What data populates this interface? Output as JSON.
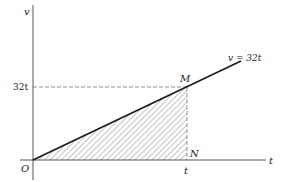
{
  "diagram": {
    "type": "velocity-time graph",
    "axes": {
      "y_label": "v",
      "x_label": "t",
      "origin_label": "O"
    },
    "line_label": "v = 32t",
    "y_tick_label": "32t",
    "x_tick_label": "t",
    "points": {
      "M": "M",
      "N": "N"
    },
    "shaded_region": "triangle OMN (hatched)",
    "colors": {
      "line": "#1a1a1a",
      "axis": "#555555",
      "dashed": "#777777",
      "hatch": "#888888"
    }
  }
}
